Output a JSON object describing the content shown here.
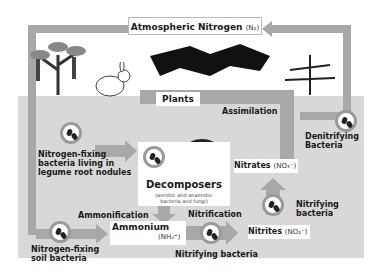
{
  "nodes": {
    "atmospheric": {
      "label": "Atmospheric Nitrogen",
      "formula": "(N₂)"
    },
    "plants": {
      "label": "Plants"
    },
    "assimilation": {
      "label": "Assimilation"
    },
    "denitrifying": {
      "line1": "Denitrifying",
      "line2": "Bacteria"
    },
    "legume": {
      "line1": "Nitrogen-fixing",
      "line2": "bacteria living in",
      "line3": "legume root nodules"
    },
    "decomposers": {
      "label": "Decomposers",
      "line1": "(aerobic and anaerobic",
      "line2": "bacteria and fungi)"
    },
    "nitrates": {
      "label": "Nitrates",
      "formula": "(NO₃⁻)"
    },
    "nitrifying_right": {
      "line1": "Nitrifying",
      "line2": "bacteria"
    },
    "ammonification": {
      "label": "Ammonification"
    },
    "ammonium": {
      "label": "Ammonium",
      "formula": "(NH₄⁺)"
    },
    "nitrification": {
      "label": "Nitrification"
    },
    "nitrites": {
      "label": "Nitrites",
      "formula": "(NO₂⁻)"
    },
    "soil_bacteria": {
      "line1": "Nitrogen-fixing",
      "line2": "soil bacteria"
    },
    "nitrifying_bottom": {
      "label": "Nitrifying bacteria"
    }
  },
  "colors": {
    "arrow": "#a8a8a8",
    "soil": "#d8d8d8",
    "box": "#ffffff"
  }
}
